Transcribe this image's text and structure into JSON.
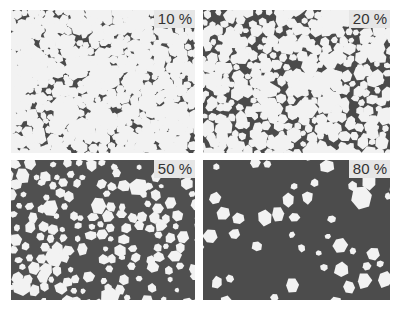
{
  "figure": {
    "panels": [
      {
        "label": "10 %",
        "fraction": 0.1,
        "matrix_color": "#4a4a4a",
        "grain_color": "#f2f2f2"
      },
      {
        "label": "20 %",
        "fraction": 0.2,
        "matrix_color": "#4a4a4a",
        "grain_color": "#f2f2f2"
      },
      {
        "label": "50 %",
        "fraction": 0.5,
        "matrix_color": "#505050",
        "grain_color": "#f2f2f2"
      },
      {
        "label": "80 %",
        "fraction": 0.8,
        "matrix_color": "#4c4c4c",
        "grain_color": "#f2f2f2"
      }
    ]
  }
}
